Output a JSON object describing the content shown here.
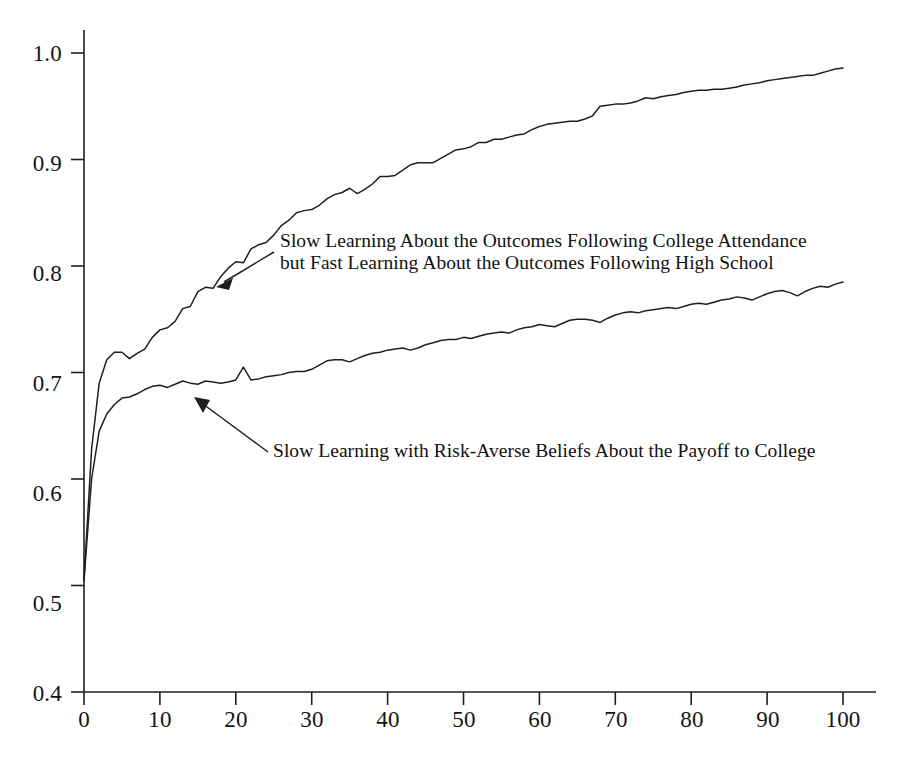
{
  "figure": {
    "background_color": "#ffffff",
    "line_color": "#1f1f1f",
    "text_color": "#141414"
  },
  "axes": {
    "y_ticks": [
      "1.0",
      "0.9",
      "0.8",
      "0.7",
      "0.6",
      "0.5",
      "0.4"
    ],
    "x_ticks": [
      "0",
      "10",
      "20",
      "30",
      "40",
      "50",
      "60",
      "70",
      "80",
      "90",
      "100"
    ]
  },
  "annotations": {
    "upper": {
      "line1": "Slow Learning About the Outcomes Following College Attendance",
      "line2": "but Fast Learning About the Outcomes Following High School"
    },
    "lower": {
      "line1": "Slow Learning with Risk-Averse Beliefs About the Payoff to College"
    }
  },
  "chart_data": {
    "type": "line",
    "title": "",
    "xlabel": "",
    "ylabel": "",
    "xlim": [
      0,
      100
    ],
    "ylim": [
      0.4,
      1.0
    ],
    "grid": false,
    "legend": "inline-annotations",
    "x": [
      0,
      1,
      2,
      3,
      4,
      5,
      6,
      7,
      8,
      9,
      10,
      11,
      12,
      13,
      14,
      15,
      16,
      17,
      18,
      19,
      20,
      21,
      22,
      23,
      24,
      25,
      26,
      27,
      28,
      29,
      30,
      31,
      32,
      33,
      34,
      35,
      36,
      37,
      38,
      39,
      40,
      41,
      42,
      43,
      44,
      45,
      46,
      47,
      48,
      49,
      50,
      51,
      52,
      53,
      54,
      55,
      56,
      57,
      58,
      59,
      60,
      61,
      62,
      63,
      64,
      65,
      66,
      67,
      68,
      69,
      70,
      71,
      72,
      73,
      74,
      75,
      76,
      77,
      78,
      79,
      80,
      81,
      82,
      83,
      84,
      85,
      86,
      87,
      88,
      89,
      90,
      91,
      92,
      93,
      94,
      95,
      96,
      97,
      98,
      99,
      100
    ],
    "series": [
      {
        "name": "Slow Learning About the Outcomes Following College Attendance but Fast Learning About the Outcomes Following High School",
        "annotation_arrow_target_x": 15,
        "annotation_arrow_target_y": 0.793,
        "values": [
          0.505,
          0.628,
          0.69,
          0.712,
          0.719,
          0.719,
          0.713,
          0.718,
          0.722,
          0.733,
          0.74,
          0.742,
          0.748,
          0.76,
          0.762,
          0.776,
          0.78,
          0.779,
          0.79,
          0.798,
          0.804,
          0.803,
          0.816,
          0.82,
          0.822,
          0.829,
          0.838,
          0.843,
          0.85,
          0.852,
          0.853,
          0.857,
          0.863,
          0.867,
          0.869,
          0.873,
          0.868,
          0.872,
          0.877,
          0.884,
          0.884,
          0.885,
          0.89,
          0.895,
          0.897,
          0.897,
          0.897,
          0.901,
          0.905,
          0.909,
          0.91,
          0.912,
          0.916,
          0.916,
          0.919,
          0.919,
          0.921,
          0.923,
          0.924,
          0.928,
          0.931,
          0.933,
          0.934,
          0.935,
          0.936,
          0.936,
          0.938,
          0.941,
          0.95,
          0.951,
          0.952,
          0.952,
          0.953,
          0.955,
          0.958,
          0.957,
          0.959,
          0.96,
          0.961,
          0.963,
          0.964,
          0.965,
          0.965,
          0.966,
          0.966,
          0.967,
          0.968,
          0.97,
          0.971,
          0.972,
          0.974,
          0.975,
          0.976,
          0.977,
          0.978,
          0.979,
          0.979,
          0.981,
          0.983,
          0.985,
          0.986
        ]
      },
      {
        "name": "Slow Learning with Risk-Averse Beliefs About the Payoff to College",
        "annotation_arrow_target_x": 9,
        "annotation_arrow_target_y": 0.69,
        "values": [
          0.505,
          0.6,
          0.645,
          0.661,
          0.67,
          0.676,
          0.677,
          0.68,
          0.684,
          0.687,
          0.688,
          0.686,
          0.689,
          0.692,
          0.69,
          0.689,
          0.692,
          0.691,
          0.69,
          0.691,
          0.693,
          0.705,
          0.693,
          0.694,
          0.696,
          0.697,
          0.698,
          0.7,
          0.701,
          0.701,
          0.703,
          0.707,
          0.711,
          0.712,
          0.712,
          0.71,
          0.713,
          0.716,
          0.718,
          0.719,
          0.721,
          0.722,
          0.723,
          0.721,
          0.723,
          0.726,
          0.728,
          0.73,
          0.731,
          0.731,
          0.733,
          0.732,
          0.734,
          0.736,
          0.737,
          0.738,
          0.737,
          0.74,
          0.742,
          0.743,
          0.745,
          0.744,
          0.743,
          0.746,
          0.749,
          0.75,
          0.75,
          0.749,
          0.747,
          0.751,
          0.754,
          0.756,
          0.757,
          0.756,
          0.758,
          0.759,
          0.76,
          0.761,
          0.76,
          0.762,
          0.764,
          0.765,
          0.764,
          0.766,
          0.768,
          0.769,
          0.771,
          0.77,
          0.768,
          0.771,
          0.774,
          0.776,
          0.777,
          0.775,
          0.772,
          0.776,
          0.779,
          0.781,
          0.78,
          0.783,
          0.785
        ]
      }
    ]
  }
}
